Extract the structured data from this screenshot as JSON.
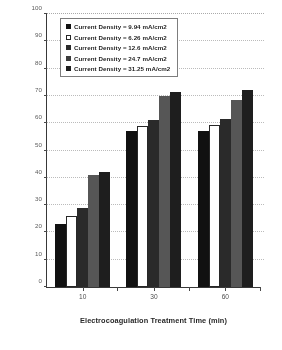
{
  "chart_data": {
    "type": "bar",
    "title": "",
    "xlabel": "Electrocoagulation Treatment Time (min)",
    "ylabel": "Removal Effeciency (%)",
    "categories": [
      "10",
      "30",
      "60"
    ],
    "ylim": [
      0,
      100
    ],
    "yticks": [
      "0",
      "10",
      "20",
      "30",
      "40",
      "50",
      "60",
      "70",
      "80",
      "90",
      "100"
    ],
    "grid": true,
    "legend_position": "top-left inside plot",
    "series": [
      {
        "name": "Current Density = 9.94 mA/cm2",
        "values": [
          23,
          57,
          57
        ]
      },
      {
        "name": "Current Density = 6.26 mA/cm2",
        "values": [
          26,
          59,
          59.5
        ]
      },
      {
        "name": "Current Density = 12.6 mA/cm2",
        "values": [
          29,
          61,
          61.5
        ]
      },
      {
        "name": "Current Density = 24.7 mA/cm2",
        "values": [
          41,
          70,
          68.5
        ]
      },
      {
        "name": "Current Density = 31.25 mA/cm2",
        "values": [
          42,
          71.5,
          72
        ]
      }
    ]
  },
  "legend": {
    "items": [
      {
        "label": "Current Density = 9.94 mA/cm2"
      },
      {
        "label": "Current Density = 6.26 mA/cm2"
      },
      {
        "label": "Current Density = 12.6 mA/cm2"
      },
      {
        "label": "Current Density = 24.7 mA/cm2"
      },
      {
        "label": "Current Density = 31.25 mA/cm2"
      }
    ]
  },
  "colors": {
    "series_0": "#151515",
    "series_1": "#ffffff",
    "series_2": "#2d2d2d",
    "series_3": "#585858",
    "series_4": "#222222",
    "axis": "#3b3b3b",
    "grid": "#b9b9b9"
  }
}
